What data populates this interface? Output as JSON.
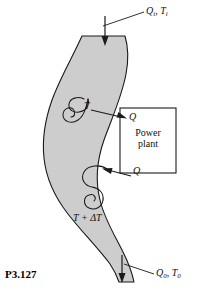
{
  "figure": {
    "caption": "P3.127",
    "type": "thermodynamics-schematic"
  },
  "colors": {
    "stream_fill": "#cdcdcd",
    "stream_stroke": "#1a1a1a",
    "line": "#1a1a1a",
    "text": "#111111",
    "background": "#ffffff"
  },
  "labels": {
    "inlet": {
      "text": "Q",
      "sub": "i",
      "second": "T",
      "second_sub": "i",
      "full": "Qi, Ti"
    },
    "outlet": {
      "text": "Q",
      "sub": "0",
      "second": "T",
      "second_sub": "0",
      "full": "Q0, T0"
    },
    "temp_upper": "T",
    "temp_lower": "T + ΔT",
    "heat_in": "Q",
    "heat_out": "Q",
    "plant_line1": "Power",
    "plant_line2": "plant"
  },
  "arrows": {
    "inlet_direction": "down",
    "outlet_direction": "down",
    "heat_to_plant_direction": "right",
    "heat_from_plant_direction": "left"
  }
}
